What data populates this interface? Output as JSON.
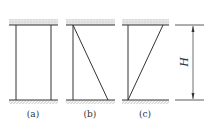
{
  "diagram": {
    "panels": [
      {
        "id": "a",
        "label": "(a)",
        "brace": "none"
      },
      {
        "id": "b",
        "label": "(b)",
        "brace": "diagonal top-left to bottom-right"
      },
      {
        "id": "c",
        "label": "(c)",
        "brace": "diagonal bottom-left to top-right"
      }
    ],
    "dimension": {
      "label": "H"
    },
    "colors": {
      "line": "#333333",
      "ceiling_fill": "#cfcfcf",
      "hatch": "#555555"
    }
  }
}
